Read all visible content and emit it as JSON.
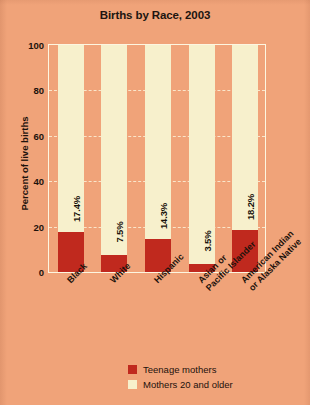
{
  "chart_data": {
    "type": "bar",
    "subtype": "stacked-bar",
    "title": "Births by Race, 2003",
    "xlabel": "",
    "ylabel": "Percent of live births",
    "ylim": [
      0,
      100
    ],
    "yticks": [
      0,
      20,
      40,
      60,
      80,
      100
    ],
    "ytick_labels": [
      "0",
      "20",
      "40",
      "60",
      "80",
      "100"
    ],
    "grid": "horizontal-dashed",
    "legend_position": "bottom-right",
    "categories": [
      "Black",
      "White",
      "Hispanic",
      "Asian or Pacific Islander",
      "American Indian or Alaska Native"
    ],
    "category_lines": [
      [
        "Black"
      ],
      [
        "White"
      ],
      [
        "Hispanic"
      ],
      [
        "Asian or",
        "Pacific Islander"
      ],
      [
        "American Indian",
        "or Alaska Native"
      ]
    ],
    "series": [
      {
        "name": "Teenage mothers",
        "color": "#c0291e",
        "values": [
          17.4,
          7.5,
          14.3,
          3.5,
          18.2
        ],
        "data_labels": [
          "17.4%",
          "7.5%",
          "14.3%",
          "3.5%",
          "18.2%"
        ]
      },
      {
        "name": "Mothers 20 and older",
        "color": "#f7f0cc",
        "values": [
          82.6,
          92.5,
          85.7,
          96.5,
          81.8
        ],
        "data_labels": []
      }
    ]
  },
  "legend": {
    "items": [
      {
        "label": "Teenage mothers",
        "color": "#c0291e"
      },
      {
        "label": "Mothers 20 and older",
        "color": "#f7f0cc"
      }
    ]
  },
  "colors": {
    "background": "#f0a379",
    "teen_bar": "#c0291e",
    "older_bar": "#f7f0cc",
    "axis": "#fdf6e0",
    "gridline": "#fbead0",
    "text": "#1d120c"
  }
}
